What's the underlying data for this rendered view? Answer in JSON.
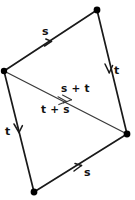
{
  "figure": {
    "type": "vector-diagram",
    "background_color": "#ffffff",
    "stroke_color": "#1a1a1a",
    "diagonal_color": "#3a3a3a",
    "width": 135,
    "height": 200
  },
  "vertices": [
    {
      "name": "left",
      "x": 4,
      "y": 71
    },
    {
      "name": "top",
      "x": 97,
      "y": 10
    },
    {
      "name": "right",
      "x": 127,
      "y": 134
    },
    {
      "name": "bottom",
      "x": 34,
      "y": 192
    }
  ],
  "edges": [
    {
      "name": "top-edge",
      "label": "s",
      "from": "left",
      "to": "top",
      "arrow_direction": "up-right",
      "label_x": 42,
      "label_y": 26
    },
    {
      "name": "right-edge",
      "label": "t",
      "from": "top",
      "to": "right",
      "arrow_direction": "down-right",
      "label_x": 114,
      "label_y": 65
    },
    {
      "name": "left-edge",
      "label": "t",
      "from": "left",
      "to": "bottom",
      "arrow_direction": "down-right",
      "label_x": 5,
      "label_y": 126
    },
    {
      "name": "bottom-edge",
      "label": "s",
      "from": "bottom",
      "to": "right",
      "arrow_direction": "up-right",
      "label_x": 84,
      "label_y": 167
    }
  ],
  "diagonal": {
    "name": "resultant-diagonal",
    "from": "left",
    "to": "right",
    "arrow_direction": "down-right",
    "labels": {
      "above": "s + t",
      "below": "t + s"
    },
    "above_label_x": 61,
    "above_label_y": 83,
    "below_label_x": 41,
    "below_label_y": 104
  }
}
